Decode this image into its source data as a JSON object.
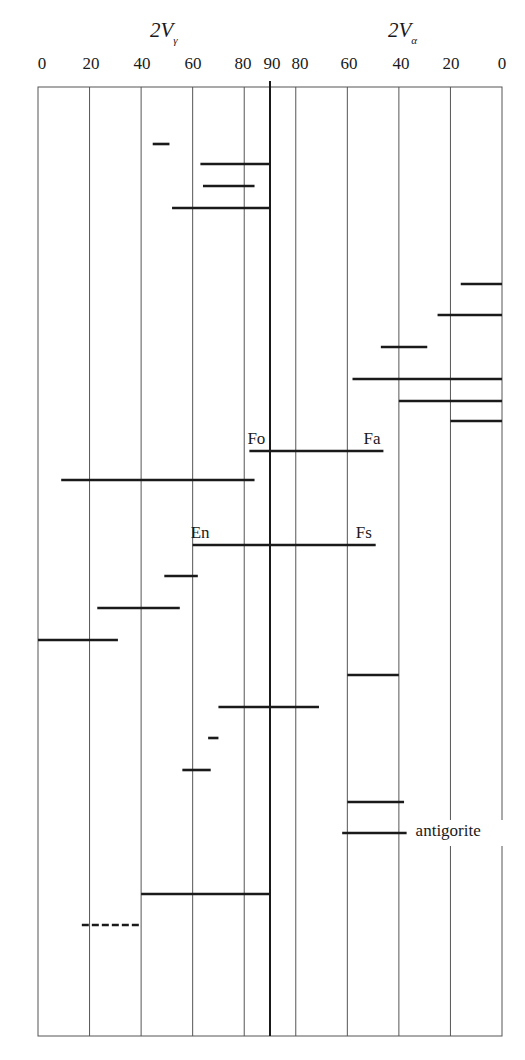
{
  "chart_data": {
    "type": "range-bars",
    "title": "",
    "axes": {
      "left": {
        "label": "2Vγ",
        "symbol": "2V",
        "subscript": "γ",
        "ticks": [
          0,
          20,
          40,
          60,
          80,
          90
        ],
        "range": [
          0,
          90
        ]
      },
      "right": {
        "label": "2Vα",
        "symbol": "2V",
        "subscript": "α",
        "ticks": [
          80,
          60,
          40,
          20,
          0
        ],
        "range": [
          90,
          0
        ]
      }
    },
    "x_mapping": "continuous optic-angle scale: 2Vγ 0→90 then 2Vα 90→0; value u in [0,180], u = 2Vγ (left) or 180 − 2Vα (right)",
    "grid": {
      "vertical_at_u": [
        20,
        40,
        60,
        80,
        100,
        120,
        140,
        160
      ],
      "center_u": 90
    },
    "series": [
      {
        "row": 1,
        "from_u": 44.5,
        "to_u": 51,
        "note": "2Vγ 45–51"
      },
      {
        "row": 2,
        "from_u": 63,
        "to_u": 90,
        "note": "2Vγ 63–90"
      },
      {
        "row": 3,
        "from_u": 64,
        "to_u": 84,
        "note": "2Vγ 64–84"
      },
      {
        "row": 4,
        "from_u": 52,
        "to_u": 90,
        "note": "2Vγ 52–90"
      },
      {
        "row": 5,
        "from_u": 164,
        "to_u": 180,
        "note": "2Vα 16–0"
      },
      {
        "row": 6,
        "from_u": 155,
        "to_u": 180,
        "note": "2Vα 25–0"
      },
      {
        "row": 7,
        "from_u": 133,
        "to_u": 151,
        "note": "2Vα 47–29"
      },
      {
        "row": 8,
        "from_u": 122,
        "to_u": 180,
        "note": "2Vα 58–0"
      },
      {
        "row": 9,
        "from_u": 140,
        "to_u": 180,
        "note": "2Vα 40–0"
      },
      {
        "row": 10,
        "from_u": 160,
        "to_u": 180,
        "note": "2Vα 20–0"
      },
      {
        "row": 11,
        "from_u": 82,
        "to_u": 134,
        "note": "Fo (2Vγ 82) – Fa (2Vα 46)",
        "start_label": "Fo",
        "end_label": "Fa"
      },
      {
        "row": 12,
        "from_u": 9,
        "to_u": 84,
        "note": "2Vγ 9–84"
      },
      {
        "row": 13,
        "from_u": 60,
        "to_u": 131,
        "note": "En (2Vγ 60) – Fs (2Vα 49)",
        "start_label": "En",
        "end_label": "Fs"
      },
      {
        "row": 14,
        "from_u": 49,
        "to_u": 62,
        "note": "2Vγ 49–62"
      },
      {
        "row": 15,
        "from_u": 23,
        "to_u": 55,
        "note": "2Vγ 23–55"
      },
      {
        "row": 16,
        "from_u": 0,
        "to_u": 31,
        "note": "2Vγ 0–31"
      },
      {
        "row": 17,
        "from_u": 120,
        "to_u": 140,
        "note": "2Vα 60–40"
      },
      {
        "row": 18,
        "from_u": 70,
        "to_u": 109,
        "note": "2Vγ 70 – 2Vα 71"
      },
      {
        "row": 19,
        "from_u": 66,
        "to_u": 70,
        "note": "2Vγ 66–70"
      },
      {
        "row": 20,
        "from_u": 56,
        "to_u": 67,
        "note": "2Vγ 56–67"
      },
      {
        "row": 21,
        "from_u": 120,
        "to_u": 142,
        "note": "2Vα 60–38"
      },
      {
        "row": 22,
        "from_u": 118,
        "to_u": 143,
        "note": "2Vα 62–37 antigorite",
        "end_label": "antigorite"
      },
      {
        "row": 23,
        "from_u": 40,
        "to_u": 90,
        "note": "2Vγ 40–90"
      },
      {
        "row": 24,
        "from_u": 17,
        "to_u": 40,
        "note": "2Vγ 17–40 (dashed)",
        "dashed": true
      }
    ],
    "annotations": [
      "Fo",
      "Fa",
      "En",
      "Fs",
      "antigorite"
    ],
    "legend": null
  },
  "header": {
    "left_title": {
      "symbol": "2V",
      "subscript": "γ"
    },
    "right_title": {
      "symbol": "2V",
      "subscript": "α"
    },
    "tick_labels": [
      "0",
      "20",
      "40",
      "60",
      "80",
      "90",
      "80",
      "60",
      "40",
      "20",
      "0"
    ]
  },
  "layout": {
    "plot_top": 87,
    "plot_bottom": 1036,
    "plot_left": 38,
    "plot_right": 502,
    "row_y": [
      144,
      164,
      186,
      208,
      284,
      315,
      347,
      379,
      401,
      421,
      451,
      480,
      545,
      576,
      608,
      640,
      675,
      707,
      738,
      770,
      802,
      833,
      894,
      925
    ],
    "colors": {
      "line": "#1a1a1a",
      "grid": "#555555",
      "background": "#ffffff"
    }
  }
}
